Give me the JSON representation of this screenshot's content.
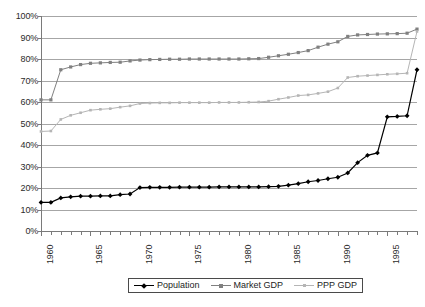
{
  "chart_data": {
    "type": "line",
    "title": "",
    "xlabel": "",
    "ylabel": "",
    "xlim": [
      1960,
      1998
    ],
    "ylim": [
      0,
      100
    ],
    "grid": true,
    "legend_position": "bottom",
    "y_ticks": [
      "0%",
      "10%",
      "20%",
      "30%",
      "40%",
      "50%",
      "60%",
      "70%",
      "80%",
      "90%",
      "100%"
    ],
    "y_tick_values": [
      0,
      10,
      20,
      30,
      40,
      50,
      60,
      70,
      80,
      90,
      100
    ],
    "x_tick_labels": [
      "1960",
      "1965",
      "1970",
      "1975",
      "1980",
      "1985",
      "1990",
      "1995"
    ],
    "x_tick_values": [
      1960,
      1965,
      1970,
      1975,
      1980,
      1985,
      1990,
      1995
    ],
    "x": [
      1960,
      1961,
      1962,
      1963,
      1964,
      1965,
      1966,
      1967,
      1968,
      1969,
      1970,
      1971,
      1972,
      1973,
      1974,
      1975,
      1976,
      1977,
      1978,
      1979,
      1980,
      1981,
      1982,
      1983,
      1984,
      1985,
      1986,
      1987,
      1988,
      1989,
      1990,
      1991,
      1992,
      1993,
      1994,
      1995,
      1996,
      1997,
      1998
    ],
    "series": [
      {
        "name": "Population",
        "color": "#000000",
        "marker": "diamond",
        "values": [
          13.3,
          13.3,
          15.4,
          15.9,
          16.2,
          16.2,
          16.3,
          16.3,
          16.9,
          17.2,
          20.2,
          20.3,
          20.3,
          20.3,
          20.4,
          20.4,
          20.4,
          20.4,
          20.5,
          20.5,
          20.5,
          20.5,
          20.5,
          20.6,
          20.8,
          21.3,
          22.0,
          22.9,
          23.5,
          24.3,
          25.0,
          27.0,
          31.8,
          35.2,
          36.3,
          53.1,
          53.3,
          53.6,
          75.0
        ]
      },
      {
        "name": "Market GDP",
        "color": "#808080",
        "marker": "square",
        "values": [
          61.0,
          61.0,
          75.0,
          76.3,
          77.4,
          78.0,
          78.2,
          78.4,
          78.5,
          79.1,
          79.5,
          79.7,
          79.8,
          79.9,
          79.9,
          80.0,
          80.0,
          80.0,
          80.0,
          80.0,
          80.0,
          80.1,
          80.2,
          80.8,
          81.5,
          82.2,
          83.0,
          83.9,
          85.5,
          86.9,
          88.0,
          90.5,
          91.2,
          91.4,
          91.6,
          91.7,
          91.8,
          92.0,
          93.9
        ]
      },
      {
        "name": "PPP GDP",
        "color": "#b5b5b5",
        "marker": "square-small",
        "values": [
          46.3,
          46.5,
          51.9,
          53.8,
          55.0,
          56.2,
          56.6,
          56.9,
          57.6,
          58.2,
          59.3,
          59.5,
          59.6,
          59.6,
          59.7,
          59.7,
          59.7,
          59.7,
          59.8,
          59.8,
          59.8,
          59.9,
          60.0,
          60.4,
          61.3,
          62.1,
          63.0,
          63.3,
          64.0,
          64.8,
          66.5,
          71.4,
          72.0,
          72.3,
          72.6,
          72.9,
          73.1,
          73.4,
          92.8
        ]
      }
    ]
  },
  "legend": {
    "entries": [
      {
        "label": "Population"
      },
      {
        "label": "Market GDP"
      },
      {
        "label": "PPP GDP"
      }
    ]
  }
}
